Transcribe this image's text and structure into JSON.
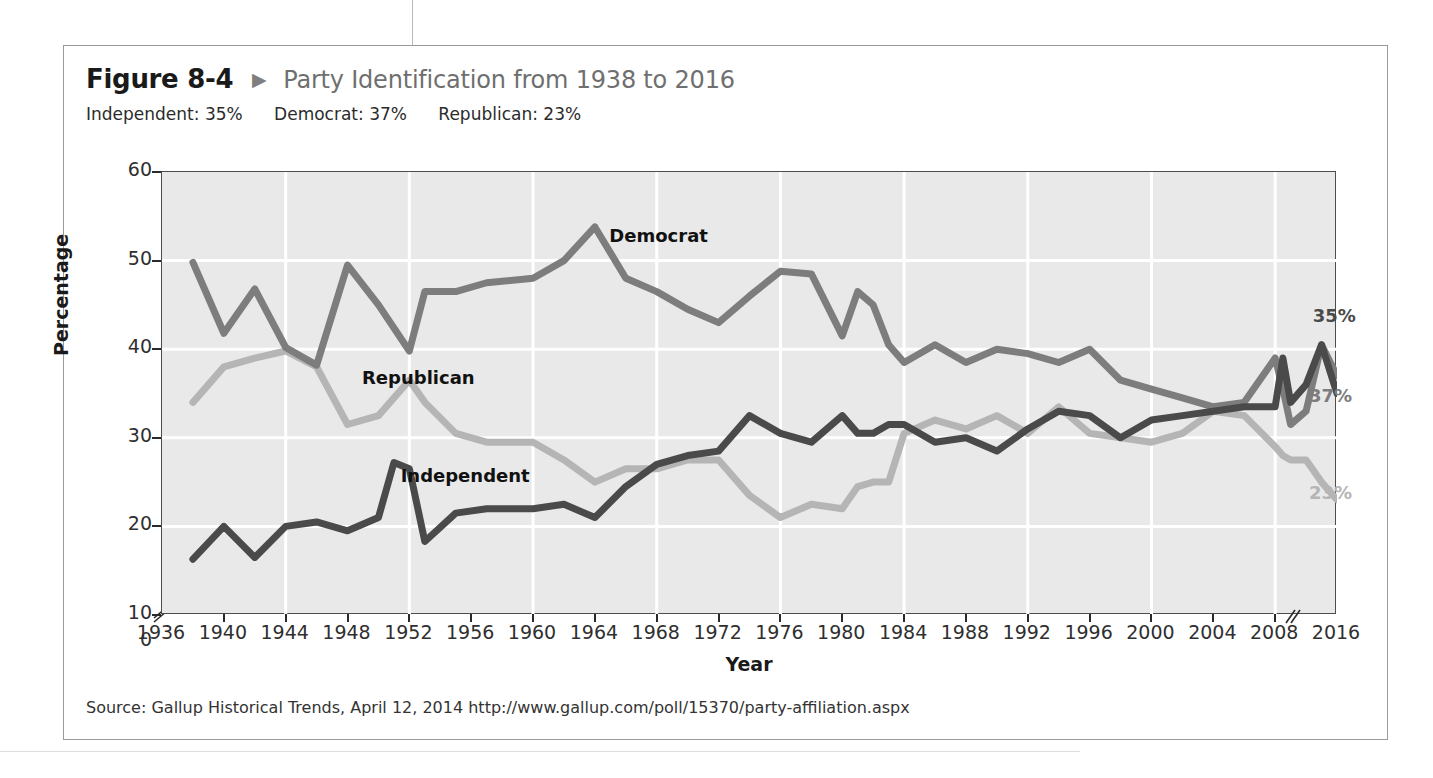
{
  "figure": {
    "number": "Figure 8-4",
    "arrow": "▶",
    "title": "Party Identification from 1938 to 2016",
    "subtitle_items": [
      "Independent: 35%",
      "Democrat: 37%",
      "Republican: 23%"
    ],
    "source": "Source: Gallup Historical Trends, April 12, 2014 http://www.gallup.com/poll/15370/party-affiliation.aspx"
  },
  "colors": {
    "independent": "#4a4a4a",
    "democrat": "#7d7d7d",
    "republican": "#b5b5b5",
    "plot_background": "#e9e9e9",
    "gridline": "#ffffff",
    "axis": "#4d4d4d",
    "title_gray": "#6f6f6f"
  },
  "chart_data": {
    "type": "line",
    "title": "Party Identification from 1938 to 2016",
    "xlabel": "Year",
    "ylabel": "Percentage",
    "ylim": [
      10,
      60
    ],
    "y_ticks": [
      10,
      20,
      30,
      40,
      50,
      60
    ],
    "y_axis_break": "between 0 and 10",
    "y_zero_label": "0",
    "xlim": [
      1936,
      2016
    ],
    "x_ticks": [
      1936,
      1940,
      1944,
      1948,
      1952,
      1956,
      1960,
      1964,
      1968,
      1972,
      1976,
      1980,
      1984,
      1988,
      1992,
      1996,
      2000,
      2004,
      2008,
      2016
    ],
    "x_axis_break": "between 2008 and 2016",
    "grid": true,
    "legend": "inline-labels",
    "annotations": [
      {
        "text": "Democrat",
        "x": 1965,
        "y": 52.5
      },
      {
        "text": "Republican",
        "x": 1949,
        "y": 36.5
      },
      {
        "text": "Independent",
        "x": 1951.5,
        "y": 25.5
      },
      {
        "text": "35%",
        "x": 2013,
        "y": 43.5
      },
      {
        "text": "37%",
        "x": 2012.5,
        "y": 34.5
      },
      {
        "text": "23%",
        "x": 2012.5,
        "y": 23.5
      }
    ],
    "series": [
      {
        "name": "Democrat",
        "color": "#7d7d7d",
        "end_label": "37%",
        "x": [
          1938,
          1940,
          1942,
          1944,
          1946,
          1948,
          1950,
          1952,
          1953,
          1955,
          1957,
          1960,
          1962,
          1964,
          1966,
          1968,
          1970,
          1972,
          1974,
          1976,
          1978,
          1980,
          1981,
          1982,
          1983,
          1984,
          1986,
          1988,
          1990,
          1992,
          1994,
          1996,
          1998,
          2000,
          2002,
          2004,
          2006,
          2008,
          2009,
          2010,
          2012,
          2014,
          2016
        ],
        "values": [
          49.8,
          41.8,
          46.8,
          40.2,
          38.2,
          49.5,
          45.0,
          39.8,
          46.5,
          46.5,
          47.5,
          48.0,
          50.0,
          53.8,
          48.0,
          46.5,
          44.5,
          43.0,
          46.0,
          48.8,
          48.5,
          41.5,
          46.5,
          45.0,
          40.5,
          38.5,
          40.5,
          38.5,
          40.0,
          39.5,
          38.5,
          40.0,
          36.5,
          35.5,
          34.5,
          33.5,
          34.0,
          39.0,
          35.5,
          31.5,
          33.0,
          40.5,
          37.0
        ]
      },
      {
        "name": "Republican",
        "color": "#b5b5b5",
        "end_label": "23%",
        "x": [
          1938,
          1940,
          1942,
          1944,
          1946,
          1948,
          1950,
          1952,
          1953,
          1955,
          1957,
          1960,
          1962,
          1964,
          1966,
          1968,
          1970,
          1972,
          1974,
          1976,
          1978,
          1980,
          1981,
          1982,
          1983,
          1984,
          1986,
          1988,
          1990,
          1992,
          1994,
          1996,
          1998,
          2000,
          2002,
          2004,
          2006,
          2008,
          2009,
          2010,
          2012,
          2014,
          2016
        ],
        "values": [
          34.0,
          38.0,
          39.0,
          39.8,
          38.0,
          31.5,
          32.5,
          36.5,
          34.0,
          30.5,
          29.5,
          29.5,
          27.5,
          25.0,
          26.5,
          26.5,
          27.5,
          27.5,
          23.5,
          21.0,
          22.5,
          22.0,
          24.5,
          25.0,
          25.0,
          30.5,
          32.0,
          31.0,
          32.5,
          30.5,
          33.5,
          30.5,
          30.0,
          29.5,
          30.5,
          33.0,
          32.5,
          29.0,
          28.0,
          27.5,
          27.5,
          25.0,
          23.0
        ]
      },
      {
        "name": "Independent",
        "color": "#4a4a4a",
        "end_label": "35%",
        "x": [
          1938,
          1940,
          1942,
          1944,
          1946,
          1948,
          1950,
          1951,
          1952,
          1953,
          1955,
          1957,
          1960,
          1962,
          1964,
          1966,
          1968,
          1970,
          1972,
          1974,
          1976,
          1978,
          1980,
          1981,
          1982,
          1983,
          1984,
          1986,
          1988,
          1990,
          1992,
          1994,
          1996,
          1998,
          2000,
          2002,
          2004,
          2006,
          2008,
          2009,
          2010,
          2012,
          2014,
          2016
        ],
        "values": [
          16.3,
          20.0,
          16.5,
          20.0,
          20.5,
          19.5,
          21.0,
          27.2,
          26.5,
          18.3,
          21.5,
          22.0,
          22.0,
          22.5,
          21.0,
          24.5,
          27.0,
          28.0,
          28.5,
          32.5,
          30.5,
          29.5,
          32.5,
          30.5,
          30.5,
          31.5,
          31.5,
          29.5,
          30.0,
          28.5,
          31.0,
          33.0,
          32.5,
          30.0,
          32.0,
          32.5,
          33.0,
          33.5,
          33.5,
          39.0,
          34.0,
          36.0,
          40.5,
          35.0
        ]
      }
    ]
  }
}
